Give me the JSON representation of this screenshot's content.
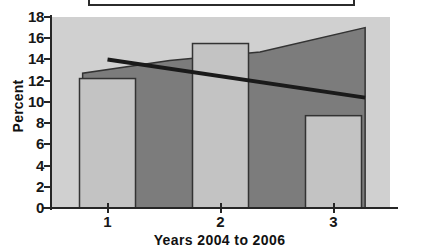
{
  "legend": {
    "name": "legend-box",
    "clipped": true,
    "border_color": "#2b2b2b"
  },
  "colors": {
    "plot_background": "#d0d0d0",
    "bar_light": "#c3c3c3",
    "area_dark": "#7c7c7c",
    "line_black": "#1a1a1a",
    "axis": "#262626",
    "text": "#111111"
  },
  "chart_data": {
    "type": "bar",
    "title": "",
    "xlabel": "Years 2004 to 2006",
    "ylabel": "Percent",
    "categories": [
      "1",
      "2",
      "3"
    ],
    "ylim": [
      0,
      18
    ],
    "yticks": [
      0,
      2,
      4,
      6,
      8,
      10,
      12,
      14,
      16,
      18
    ],
    "ytick_labels": [
      "0",
      "2",
      "4",
      "6",
      "8",
      "10",
      "12",
      "14",
      "16",
      "18"
    ],
    "xlim": [
      0.5,
      3.5
    ],
    "grid": false,
    "legend_position": "above-plot",
    "series": [
      {
        "name": "bars",
        "type": "bar",
        "color": "#c3c3c3",
        "edge_color": "#333333",
        "values": [
          12.2,
          15.5,
          8.7
        ]
      },
      {
        "name": "area",
        "type": "area",
        "color": "#7c7c7c",
        "edge_color": "#333333",
        "x": [
          0.78,
          1.55,
          2.35,
          3.28
        ],
        "values": [
          12.7,
          13.9,
          14.7,
          17.0
        ]
      },
      {
        "name": "trend-line",
        "type": "line",
        "color": "#1a1a1a",
        "x": [
          1.0,
          3.28
        ],
        "values": [
          14.0,
          10.4
        ]
      }
    ]
  }
}
